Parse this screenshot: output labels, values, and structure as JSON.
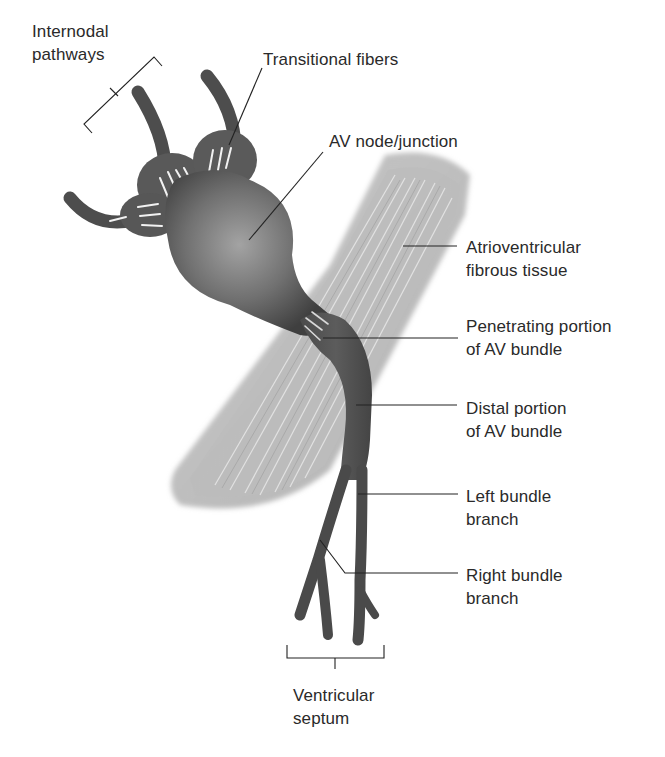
{
  "figure": {
    "colors": {
      "background": "#ffffff",
      "conduction_tissue": "#4a4a4a",
      "conduction_highlight": "#8c8c8c",
      "fibrous_tissue": "#b8b8b8",
      "leader_line": "#222222",
      "label_text": "#2a2a2a"
    }
  },
  "labels": {
    "internodal": {
      "line1": "Internodal",
      "line2": "pathways"
    },
    "transitional": {
      "line1": "Transitional fibers"
    },
    "av_node": {
      "line1": "AV node/junction"
    },
    "av_fibrous": {
      "line1": "Atrioventricular",
      "line2": "fibrous tissue"
    },
    "penetrating": {
      "line1": "Penetrating portion",
      "line2": "of AV bundle"
    },
    "distal": {
      "line1": "Distal portion",
      "line2": "of AV bundle"
    },
    "left_branch": {
      "line1": "Left bundle",
      "line2": "branch"
    },
    "right_branch": {
      "line1": "Right bundle",
      "line2": "branch"
    },
    "septum": {
      "line1": "Ventricular",
      "line2": "septum"
    }
  }
}
